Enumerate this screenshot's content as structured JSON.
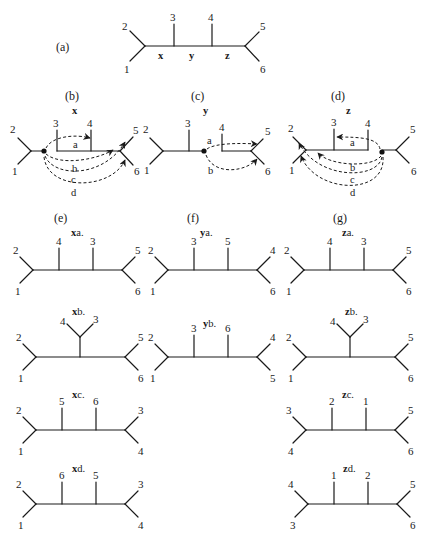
{
  "figure": {
    "panels": {
      "a": {
        "letter": "(a)",
        "edge_labels": [
          "x",
          "y",
          "z"
        ],
        "leaves": [
          "1",
          "2",
          "3",
          "4",
          "5",
          "6"
        ]
      },
      "b": {
        "letter": "(b)",
        "edge": "x",
        "moves": [
          "a",
          "b",
          "c",
          "d"
        ],
        "leaves": [
          "1",
          "2",
          "3",
          "4",
          "5",
          "6"
        ]
      },
      "c": {
        "letter": "(c)",
        "edge": "y",
        "moves": [
          "a",
          "b"
        ],
        "leaves": [
          "1",
          "2",
          "3",
          "4",
          "5",
          "6"
        ]
      },
      "d": {
        "letter": "(d)",
        "edge": "z",
        "moves": [
          "a",
          "b",
          "c",
          "d"
        ],
        "leaves": [
          "1",
          "2",
          "3",
          "4",
          "5",
          "6"
        ]
      },
      "e": {
        "letter": "(e)"
      },
      "f": {
        "letter": "(f)"
      },
      "g": {
        "letter": "(g)"
      }
    },
    "trees": [
      {
        "id": "xa",
        "edge": "x",
        "move": "a.",
        "left": [
          "2",
          "1"
        ],
        "mid": [
          "4",
          "3"
        ],
        "right": [
          "5",
          "6"
        ],
        "shape": "cat"
      },
      {
        "id": "ya",
        "edge": "y",
        "move": "a.",
        "left": [
          "2",
          "1"
        ],
        "mid": [
          "3",
          "5"
        ],
        "right": [
          "4",
          "6"
        ],
        "shape": "cat"
      },
      {
        "id": "za",
        "edge": "z",
        "move": "a.",
        "left": [
          "2",
          "1"
        ],
        "mid": [
          "4",
          "3"
        ],
        "right": [
          "5",
          "6"
        ],
        "shape": "cat"
      },
      {
        "id": "xb",
        "edge": "x",
        "move": "b.",
        "left": [
          "2",
          "1"
        ],
        "mid": [
          "4",
          "3"
        ],
        "right": [
          "5",
          "6"
        ],
        "shape": "sym"
      },
      {
        "id": "yb",
        "edge": "y",
        "move": "b.",
        "left": [
          "2",
          "1"
        ],
        "mid": [
          "3",
          "6"
        ],
        "right": [
          "4",
          "5"
        ],
        "shape": "cat"
      },
      {
        "id": "zb",
        "edge": "z",
        "move": "b.",
        "left": [
          "2",
          "1"
        ],
        "mid": [
          "4",
          "3"
        ],
        "right": [
          "5",
          "6"
        ],
        "shape": "sym"
      },
      {
        "id": "xc",
        "edge": "x",
        "move": "c.",
        "left": [
          "2",
          "1"
        ],
        "mid": [
          "5",
          "6"
        ],
        "right": [
          "3",
          "4"
        ],
        "shape": "cat"
      },
      {
        "id": "zc",
        "edge": "z",
        "move": "c.",
        "left": [
          "3",
          "4"
        ],
        "mid": [
          "2",
          "1"
        ],
        "right": [
          "5",
          "6"
        ],
        "shape": "cat"
      },
      {
        "id": "xd",
        "edge": "x",
        "move": "d.",
        "left": [
          "2",
          "1"
        ],
        "mid": [
          "6",
          "5"
        ],
        "right": [
          "3",
          "4"
        ],
        "shape": "cat"
      },
      {
        "id": "zd",
        "edge": "z",
        "move": "d.",
        "left": [
          "4",
          "3"
        ],
        "mid": [
          "1",
          "2"
        ],
        "right": [
          "5",
          "6"
        ],
        "shape": "cat"
      }
    ]
  }
}
